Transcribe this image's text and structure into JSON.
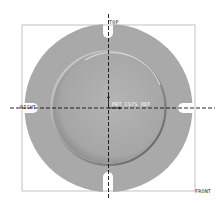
{
  "viewport": {
    "background": "#ffffff",
    "part_color": "#a9a9a9",
    "datum_planes": [
      {
        "name": "TOP",
        "label": "TOP"
      },
      {
        "name": "RIGHT",
        "label": "RIGHT"
      },
      {
        "name": "FRONT",
        "label": "FRONT"
      }
    ],
    "csys": {
      "label": "PRT_CSYS_DEF"
    }
  }
}
